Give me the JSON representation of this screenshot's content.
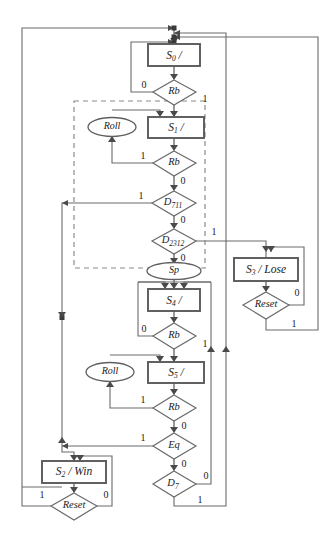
{
  "diagram": {
    "type": "asm-flowchart",
    "colors": {
      "wire": "#6b6b6b",
      "box_stroke": "#5a5a5a",
      "dashed_group": "#8a8a8a",
      "text": "#1a1a1a",
      "background": "#ffffff"
    },
    "states": [
      {
        "id": "s0",
        "label": "S",
        "subscript": "0",
        "suffix": " /",
        "output": ""
      },
      {
        "id": "s1",
        "label": "S",
        "subscript": "1",
        "suffix": " /",
        "output": ""
      },
      {
        "id": "s4",
        "label": "S",
        "subscript": "4",
        "suffix": " /",
        "output": ""
      },
      {
        "id": "s5",
        "label": "S",
        "subscript": "5",
        "suffix": " /",
        "output": ""
      },
      {
        "id": "s3",
        "label": "S",
        "subscript": "3",
        "suffix": " / Lose",
        "output": "Lose"
      },
      {
        "id": "s2",
        "label": "S",
        "subscript": "2",
        "suffix": " / Win",
        "output": "Win"
      }
    ],
    "decisions": [
      {
        "id": "d_rb0",
        "label": "Rb",
        "subscript": ""
      },
      {
        "id": "d_rb1",
        "label": "Rb",
        "subscript": ""
      },
      {
        "id": "d_711",
        "label": "D",
        "subscript": "711"
      },
      {
        "id": "d_2312",
        "label": "D",
        "subscript": "2312"
      },
      {
        "id": "d_reset3",
        "label": "Reset",
        "subscript": ""
      },
      {
        "id": "d_rb4",
        "label": "Rb",
        "subscript": ""
      },
      {
        "id": "d_rb5",
        "label": "Rb",
        "subscript": ""
      },
      {
        "id": "d_eq",
        "label": "Eq",
        "subscript": ""
      },
      {
        "id": "d_d7",
        "label": "D",
        "subscript": "7"
      },
      {
        "id": "d_reset2",
        "label": "Reset",
        "subscript": ""
      }
    ],
    "outputs": [
      {
        "id": "roll_top",
        "label": "Roll"
      },
      {
        "id": "sp",
        "label": "Sp"
      },
      {
        "id": "roll_bottom",
        "label": "Roll"
      }
    ],
    "branch_labels": {
      "rb0_false": "0",
      "rb0_true": "1",
      "rb1_true": "1",
      "rb1_false": "0",
      "d711_true": "1",
      "d711_false": "0",
      "d2312_true": "1",
      "d2312_false": "0",
      "reset3_false": "0",
      "reset3_true": "1",
      "rb4_false": "0",
      "rb4_true": "1",
      "rb5_true": "1",
      "rb5_false": "0",
      "eq_true": "1",
      "eq_false": "0",
      "d7_false": "0",
      "d7_true": "1",
      "reset2_true": "1",
      "reset2_false": "0"
    }
  }
}
